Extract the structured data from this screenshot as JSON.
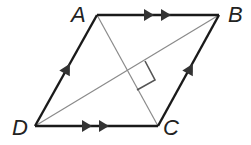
{
  "figure": {
    "type": "rhombus",
    "vertices": {
      "A": {
        "label": "A",
        "x": 97,
        "y": 15
      },
      "B": {
        "label": "B",
        "x": 219,
        "y": 15
      },
      "C": {
        "label": "C",
        "x": 158,
        "y": 126
      },
      "D": {
        "label": "D",
        "x": 35,
        "y": 126
      }
    },
    "sides": [
      {
        "from": "A",
        "to": "B",
        "marks": "double-arrow"
      },
      {
        "from": "D",
        "to": "C",
        "marks": "double-arrow"
      },
      {
        "from": "D",
        "to": "A",
        "marks": "single-arrow"
      },
      {
        "from": "C",
        "to": "B",
        "marks": "single-arrow"
      }
    ],
    "diagonals": [
      {
        "from": "A",
        "to": "C"
      },
      {
        "from": "D",
        "to": "B"
      }
    ],
    "annotations": [
      "right-angle-at-diagonal-intersection"
    ],
    "colors": {
      "side": "#1a1a1a",
      "diagonal": "#8a8a8a",
      "marker": "#555555"
    }
  },
  "labels": {
    "A": "A",
    "B": "B",
    "C": "C",
    "D": "D"
  }
}
